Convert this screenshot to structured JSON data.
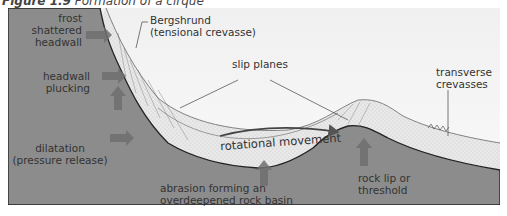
{
  "figure": {
    "number": "Figure 1.9",
    "caption": "Formation of a cirque"
  },
  "labels": {
    "frost_shattered": [
      "frost",
      "shattered",
      "headwall"
    ],
    "bergshrund": [
      "Bergshrund",
      "(tensional crevasse)"
    ],
    "headwall_plucking": [
      "headwall",
      "plucking"
    ],
    "slip_planes": "slip planes",
    "dilatation": [
      "dilatation",
      "(pressure release)"
    ],
    "rotational_movement": "rotational movement",
    "abrasion": [
      "abrasion forming an",
      "overdeepened rock basin"
    ],
    "rock_lip": [
      "rock lip or",
      "threshold"
    ],
    "transverse": [
      "transverse",
      "crevasses"
    ]
  },
  "colors": {
    "rock": "#8c8c8c",
    "sky": "#f4f4f4",
    "ice": "#e6e6e6",
    "outline": "#222222",
    "arrow": "#6e6e6e"
  }
}
